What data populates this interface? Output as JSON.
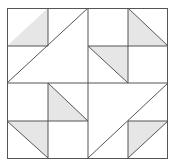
{
  "diagram": {
    "type": "quilt-block",
    "grid": {
      "rows": 4,
      "cols": 4
    },
    "colors": {
      "background": "#ffffff",
      "line": "#555555",
      "shade": "#e6e6e6"
    },
    "shaded_triangles": [
      {
        "cell": "r0c0",
        "diagonal": "bottom-left-to-top-right",
        "shaded_side": "lower-right"
      },
      {
        "cell": "r0c3",
        "diagonal": "top-left-to-bottom-right",
        "shaded_side": "lower-left"
      },
      {
        "cell": "r1c2",
        "diagonal": "top-left-to-bottom-right",
        "shaded_side": "upper-right"
      },
      {
        "cell": "r2c1",
        "diagonal": "top-left-to-bottom-right",
        "shaded_side": "lower-left"
      },
      {
        "cell": "r3c0",
        "diagonal": "top-left-to-bottom-right",
        "shaded_side": "upper-right"
      },
      {
        "cell": "r3c3",
        "diagonal": "bottom-left-to-top-right",
        "shaded_side": "upper-left"
      }
    ],
    "large_diagonals": [
      {
        "from": "r1c0-bottom-left",
        "to": "r0c1-top-right"
      },
      {
        "from": "r3c2-bottom-left",
        "to": "r2c3-top-right"
      }
    ]
  }
}
